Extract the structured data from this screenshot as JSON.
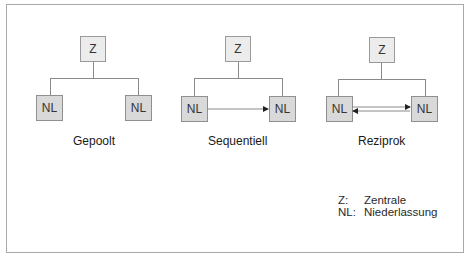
{
  "diagrams": [
    {
      "title": "Gepoolt",
      "nodes": {
        "top": "Z",
        "left": "NL",
        "right": "NL"
      },
      "connection": "none"
    },
    {
      "title": "Sequentiell",
      "nodes": {
        "top": "Z",
        "left": "NL",
        "right": "NL"
      },
      "connection": "one-way arrow left to right"
    },
    {
      "title": "Reziprok",
      "nodes": {
        "top": "Z",
        "left": "NL",
        "right": "NL"
      },
      "connection": "two-way arrows"
    }
  ],
  "legend": [
    {
      "key": "Z:",
      "value": "Zentrale"
    },
    {
      "key": "NL:",
      "value": "Niederlassung"
    }
  ],
  "colors": {
    "border": "#a9a9a9",
    "z_box_fill": "#ececec",
    "nl_box_fill": "#d9d9d9",
    "line": "#8a8a8a"
  }
}
